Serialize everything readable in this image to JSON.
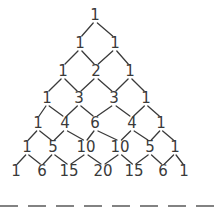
{
  "diagram": {
    "rows": [
      {
        "values": [
          "1"
        ],
        "x": [
          95
        ],
        "y": 20
      },
      {
        "values": [
          "1",
          "1"
        ],
        "x": [
          80,
          115
        ],
        "y": 48
      },
      {
        "values": [
          "1",
          "2",
          "1"
        ],
        "x": [
          63,
          96,
          130
        ],
        "y": 76
      },
      {
        "values": [
          "1",
          "3",
          "3",
          "1"
        ],
        "x": [
          47,
          79,
          114,
          146
        ],
        "y": 103
      },
      {
        "values": [
          "1",
          "4",
          "6",
          "4",
          "1"
        ],
        "x": [
          38,
          65,
          95,
          132,
          161
        ],
        "y": 128
      },
      {
        "values": [
          "1",
          "5",
          "10",
          "10",
          "5",
          "1"
        ],
        "x": [
          27,
          53,
          86,
          120,
          150,
          175
        ],
        "y": 152
      },
      {
        "values": [
          "1",
          "6",
          "15",
          "20",
          "15",
          "6",
          "1"
        ],
        "x": [
          16,
          42,
          69,
          103,
          134,
          163,
          184
        ],
        "y": 176
      }
    ],
    "dashed_line": {
      "y": 206,
      "x1": 0,
      "x2": 214,
      "color": "#5a5a5a"
    },
    "text_color": "#3a3a3a"
  }
}
